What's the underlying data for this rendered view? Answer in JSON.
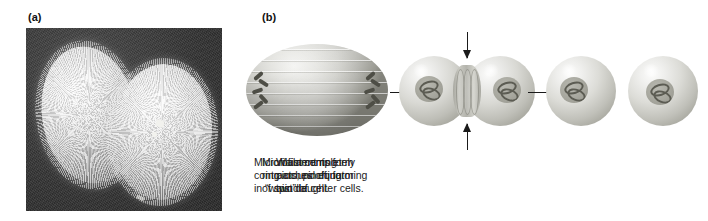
{
  "figure": {
    "panels": {
      "a": {
        "label": "(a)"
      },
      "b": {
        "label": "(b)"
      }
    }
  },
  "micrograph": {
    "name": "electron micrograph of dividing cell"
  },
  "diagram": {
    "stages": [
      {
        "id": "spindle",
        "caption": "Microfilaments form\nring around equator\nof spindle."
      },
      {
        "id": "cleaving",
        "caption": "Microfilament ring\ncontracts, pinching\nin “waist” of cell."
      },
      {
        "id": "daughters",
        "caption": "Waist completely\npinches off, forming\ntwo daughter cells."
      }
    ]
  },
  "colors": {
    "micrograph_background": "#3a3a3a",
    "cell_highlight": "#f4f4f2",
    "cell_shadow": "#84847c",
    "nucleus": "#a6a69d",
    "chromatin": "#5c5c53",
    "arrow": "#1a1a1a",
    "text": "#1b1b1b",
    "page_background": "#ffffff"
  }
}
